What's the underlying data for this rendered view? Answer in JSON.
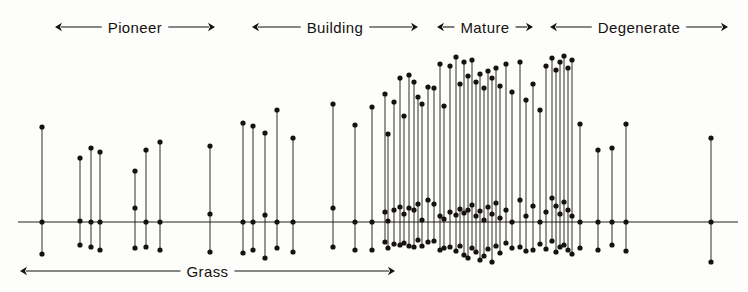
{
  "figure": {
    "background_color": "#fdfdfc",
    "ink_color": "#15120f"
  },
  "axis": {
    "baseline_y": 222,
    "baseline_x_start": 18,
    "baseline_x_end": 738,
    "label": "baseline"
  },
  "top_phases": [
    {
      "label": "Pioneer",
      "x_start": 55,
      "x_end": 215,
      "y": 27
    },
    {
      "label": "Building",
      "x_start": 252,
      "x_end": 418,
      "y": 27
    },
    {
      "label": "Mature",
      "x_start": 437,
      "x_end": 533,
      "y": 27
    },
    {
      "label": "Degenerate",
      "x_start": 550,
      "x_end": 728,
      "y": 27
    }
  ],
  "bottom_phases": [
    {
      "label": "Grass",
      "x_start": 20,
      "x_end": 395,
      "y": 271
    }
  ],
  "chart_data": {
    "type": "scatter",
    "xlabel": "",
    "ylabel": "",
    "grid": false,
    "legend": "none",
    "baseline_y": 222,
    "xlim": [
      0,
      748
    ],
    "ylim": [
      292,
      0
    ],
    "series": [
      {
        "x": 42,
        "top": 127,
        "mid": 222,
        "bottom": 254
      },
      {
        "x": 80,
        "top": 158,
        "mid": 221,
        "bottom": 245
      },
      {
        "x": 91,
        "top": 148,
        "mid": 222,
        "bottom": 247
      },
      {
        "x": 100,
        "top": 152,
        "mid": 222,
        "bottom": 250
      },
      {
        "x": 135,
        "top": 171,
        "mid": 208,
        "bottom": 248
      },
      {
        "x": 146,
        "top": 150,
        "mid": 222,
        "bottom": 247
      },
      {
        "x": 160,
        "top": 142,
        "mid": 222,
        "bottom": 250
      },
      {
        "x": 210,
        "top": 146,
        "mid": 214,
        "bottom": 252
      },
      {
        "x": 243,
        "top": 123,
        "mid": 222,
        "bottom": 253
      },
      {
        "x": 253,
        "top": 126,
        "mid": 222,
        "bottom": 250
      },
      {
        "x": 265,
        "top": 133,
        "mid": 215,
        "bottom": 258
      },
      {
        "x": 277,
        "top": 110,
        "mid": 222,
        "bottom": 248
      },
      {
        "x": 293,
        "top": 138,
        "mid": 222,
        "bottom": 252
      },
      {
        "x": 333,
        "top": 104,
        "mid": 208,
        "bottom": 247
      },
      {
        "x": 355,
        "top": 125,
        "mid": 222,
        "bottom": 250
      },
      {
        "x": 372,
        "top": 107,
        "mid": 222,
        "bottom": 250
      },
      {
        "x": 385,
        "top": 94,
        "mid": 212,
        "bottom": 242
      },
      {
        "x": 388,
        "top": 134,
        "mid": 221,
        "bottom": 248
      },
      {
        "x": 394,
        "top": 102,
        "mid": 210,
        "bottom": 244
      },
      {
        "x": 400,
        "top": 78,
        "mid": 207,
        "bottom": 245
      },
      {
        "x": 404,
        "top": 116,
        "mid": 214,
        "bottom": 243
      },
      {
        "x": 409,
        "top": 75,
        "mid": 208,
        "bottom": 246
      },
      {
        "x": 414,
        "top": 82,
        "mid": 210,
        "bottom": 247
      },
      {
        "x": 418,
        "top": 97,
        "mid": 204,
        "bottom": 240
      },
      {
        "x": 422,
        "top": 104,
        "mid": 220,
        "bottom": 246
      },
      {
        "x": 428,
        "top": 87,
        "mid": 200,
        "bottom": 242
      },
      {
        "x": 434,
        "top": 88,
        "mid": 204,
        "bottom": 241
      },
      {
        "x": 440,
        "top": 64,
        "mid": 216,
        "bottom": 250
      },
      {
        "x": 444,
        "top": 106,
        "mid": 219,
        "bottom": 248
      },
      {
        "x": 450,
        "top": 66,
        "mid": 212,
        "bottom": 247
      },
      {
        "x": 456,
        "top": 57,
        "mid": 215,
        "bottom": 251
      },
      {
        "x": 460,
        "top": 84,
        "mid": 209,
        "bottom": 246
      },
      {
        "x": 464,
        "top": 62,
        "mid": 213,
        "bottom": 255
      },
      {
        "x": 468,
        "top": 76,
        "mid": 210,
        "bottom": 258
      },
      {
        "x": 472,
        "top": 60,
        "mid": 205,
        "bottom": 248
      },
      {
        "x": 476,
        "top": 82,
        "mid": 216,
        "bottom": 252
      },
      {
        "x": 480,
        "top": 74,
        "mid": 211,
        "bottom": 260
      },
      {
        "x": 484,
        "top": 88,
        "mid": 220,
        "bottom": 256
      },
      {
        "x": 488,
        "top": 71,
        "mid": 207,
        "bottom": 249
      },
      {
        "x": 492,
        "top": 78,
        "mid": 214,
        "bottom": 262
      },
      {
        "x": 496,
        "top": 68,
        "mid": 203,
        "bottom": 246
      },
      {
        "x": 500,
        "top": 86,
        "mid": 218,
        "bottom": 253
      },
      {
        "x": 506,
        "top": 64,
        "mid": 210,
        "bottom": 243
      },
      {
        "x": 512,
        "top": 92,
        "mid": 222,
        "bottom": 248
      },
      {
        "x": 520,
        "top": 62,
        "mid": 200,
        "bottom": 247
      },
      {
        "x": 526,
        "top": 100,
        "mid": 216,
        "bottom": 251
      },
      {
        "x": 533,
        "top": 84,
        "mid": 206,
        "bottom": 250
      },
      {
        "x": 540,
        "top": 110,
        "mid": 222,
        "bottom": 244
      },
      {
        "x": 546,
        "top": 66,
        "mid": 212,
        "bottom": 249
      },
      {
        "x": 552,
        "top": 58,
        "mid": 198,
        "bottom": 241
      },
      {
        "x": 556,
        "top": 70,
        "mid": 206,
        "bottom": 252
      },
      {
        "x": 560,
        "top": 62,
        "mid": 214,
        "bottom": 247
      },
      {
        "x": 564,
        "top": 56,
        "mid": 202,
        "bottom": 245
      },
      {
        "x": 568,
        "top": 68,
        "mid": 210,
        "bottom": 250
      },
      {
        "x": 572,
        "top": 60,
        "mid": 216,
        "bottom": 254
      },
      {
        "x": 580,
        "top": 124,
        "mid": 222,
        "bottom": 248
      },
      {
        "x": 598,
        "top": 150,
        "mid": 222,
        "bottom": 250
      },
      {
        "x": 612,
        "top": 148,
        "mid": 222,
        "bottom": 245
      },
      {
        "x": 626,
        "top": 124,
        "mid": 222,
        "bottom": 251
      },
      {
        "x": 711,
        "top": 138,
        "mid": 222,
        "bottom": 262
      }
    ]
  }
}
